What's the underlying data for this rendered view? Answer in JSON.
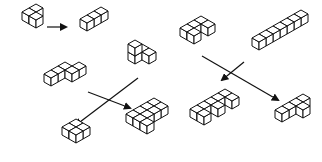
{
  "figure": {
    "colors": {
      "stroke": "#111111",
      "top": "#ffffff",
      "left": "#ffffff",
      "right": "#ffffff",
      "background": "#ffffff"
    },
    "cube": {
      "w": 7,
      "h": 4,
      "d": 8
    }
  },
  "pieces": [
    {
      "name": "piece-v-tricube",
      "origin": [
        22,
        20
      ],
      "cubes": [
        [
          0,
          0,
          0
        ],
        [
          1,
          0,
          0
        ],
        [
          0,
          1,
          0
        ]
      ]
    },
    {
      "name": "piece-i-tricube",
      "origin": [
        80,
        27
      ],
      "cubes": [
        [
          0,
          0,
          0
        ],
        [
          1,
          0,
          0
        ],
        [
          2,
          0,
          0
        ]
      ]
    },
    {
      "name": "piece-s-tetracube",
      "origin": [
        44,
        82
      ],
      "cubes": [
        [
          0,
          0,
          0
        ],
        [
          1,
          0,
          0
        ],
        [
          2,
          0,
          0
        ],
        [
          2,
          1,
          0
        ],
        [
          3,
          1,
          0
        ]
      ]
    },
    {
      "name": "piece-l-small",
      "origin": [
        128,
        60
      ],
      "cubes": [
        [
          0,
          0,
          0
        ],
        [
          1,
          0,
          0
        ],
        [
          1,
          1,
          0
        ],
        [
          0,
          0,
          1
        ]
      ]
    },
    {
      "name": "piece-square",
      "origin": [
        62,
        135
      ],
      "cubes": [
        [
          0,
          0,
          0
        ],
        [
          1,
          0,
          0
        ],
        [
          0,
          1,
          0
        ],
        [
          1,
          1,
          0
        ]
      ]
    },
    {
      "name": "piece-u-composite",
      "origin": [
        126,
        122
      ],
      "cubes": [
        [
          0,
          0,
          0
        ],
        [
          1,
          0,
          0
        ],
        [
          2,
          0,
          0
        ],
        [
          0,
          1,
          0
        ],
        [
          1,
          1,
          0
        ],
        [
          2,
          1,
          0
        ],
        [
          3,
          1,
          0
        ],
        [
          0,
          2,
          0
        ],
        [
          3,
          0,
          0
        ]
      ]
    },
    {
      "name": "piece-c-pentacube",
      "origin": [
        180,
        36
      ],
      "cubes": [
        [
          0,
          0,
          0
        ],
        [
          1,
          0,
          0
        ],
        [
          2,
          0,
          0
        ],
        [
          2,
          1,
          0
        ],
        [
          0,
          1,
          0
        ]
      ]
    },
    {
      "name": "piece-long-bar",
      "origin": [
        252,
        46
      ],
      "cubes": [
        [
          0,
          0,
          0
        ],
        [
          1,
          0,
          0
        ],
        [
          2,
          0,
          0
        ],
        [
          3,
          0,
          0
        ],
        [
          4,
          0,
          0
        ],
        [
          5,
          0,
          0
        ],
        [
          6,
          0,
          0
        ]
      ]
    },
    {
      "name": "piece-comb",
      "origin": [
        190,
        117
      ],
      "cubes": [
        [
          0,
          0,
          0
        ],
        [
          1,
          0,
          0
        ],
        [
          2,
          0,
          0
        ],
        [
          3,
          0,
          0
        ],
        [
          4,
          0,
          0
        ],
        [
          0,
          1,
          0
        ],
        [
          2,
          1,
          0
        ],
        [
          4,
          1,
          0
        ]
      ]
    },
    {
      "name": "piece-t-pentacube",
      "origin": [
        275,
        118
      ],
      "cubes": [
        [
          0,
          0,
          0
        ],
        [
          1,
          0,
          0
        ],
        [
          2,
          0,
          0
        ],
        [
          3,
          0,
          0
        ],
        [
          2,
          1,
          0
        ]
      ]
    }
  ],
  "arrows": [
    {
      "name": "arrow-v-to-i",
      "from": [
        47,
        27
      ],
      "to": [
        66,
        27
      ]
    },
    {
      "name": "arrow-s-to-u",
      "from": [
        88,
        92
      ],
      "to": [
        130,
        108
      ]
    },
    {
      "name": "arrow-l-to-square",
      "from": [
        138,
        78
      ],
      "to": [
        76,
        125
      ]
    },
    {
      "name": "arrow-c-to-t",
      "from": [
        202,
        56
      ],
      "to": [
        278,
        100
      ]
    },
    {
      "name": "arrow-bar-to-comb",
      "from": [
        244,
        62
      ],
      "to": [
        222,
        80
      ]
    }
  ]
}
